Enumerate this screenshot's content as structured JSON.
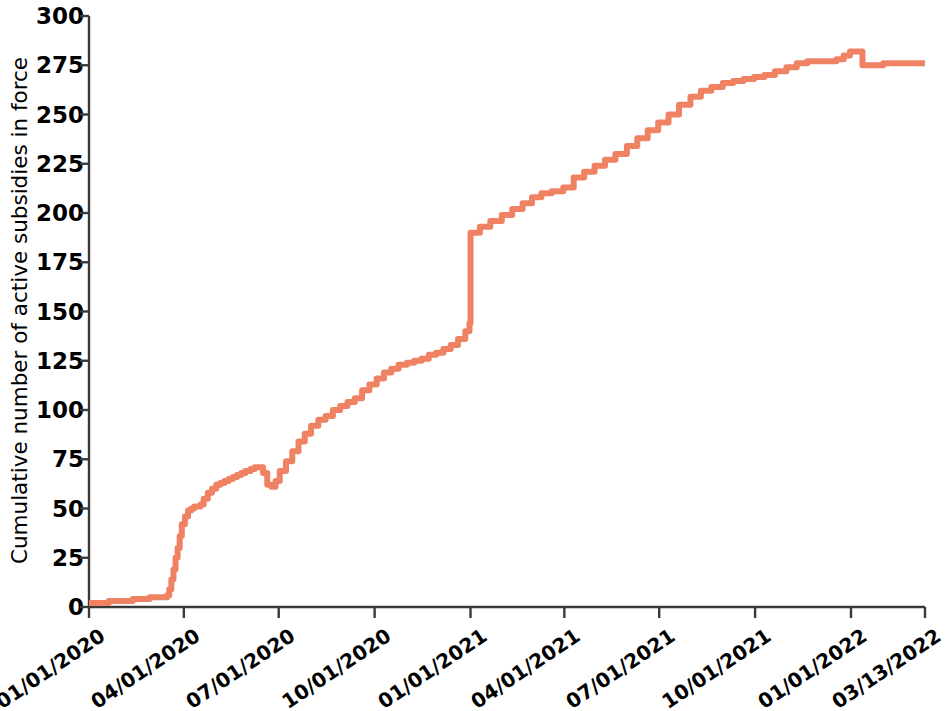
{
  "chart_data": {
    "type": "line",
    "title": "",
    "xlabel": "",
    "ylabel": "Cumulative number of active subsidies in force",
    "ylim": [
      0,
      300
    ],
    "ytick_labels": [
      "300",
      "275",
      "250",
      "225",
      "200",
      "175",
      "150",
      "125",
      "100",
      "75",
      "50",
      "25",
      "0"
    ],
    "ytick_values": [
      300,
      275,
      250,
      225,
      200,
      175,
      150,
      125,
      100,
      75,
      50,
      25,
      0
    ],
    "xtick_labels": [
      "01/01/2020",
      "04/01/2020",
      "07/01/2020",
      "10/01/2020",
      "01/01/2021",
      "04/01/2021",
      "07/01/2021",
      "10/01/2021",
      "01/01/2022",
      "03/13/2022"
    ],
    "grid": false,
    "legend": "none",
    "line_color": "#F08264",
    "line_width": 6,
    "step_shape": "post",
    "x_start": "01/01/2020",
    "x_end": "03/13/2022",
    "series": [
      {
        "name": "Cumulative active subsidies in force",
        "x": [
          "01/01/2020",
          "01/08/2020",
          "01/20/2020",
          "02/01/2020",
          "02/12/2020",
          "02/20/2020",
          "02/28/2020",
          "03/05/2020",
          "03/12/2020",
          "03/16/2020",
          "03/18/2020",
          "03/20/2020",
          "03/22/2020",
          "03/24/2020",
          "03/26/2020",
          "03/28/2020",
          "03/30/2020",
          "04/02/2020",
          "04/05/2020",
          "04/08/2020",
          "04/11/2020",
          "04/14/2020",
          "04/17/2020",
          "04/20/2020",
          "04/24/2020",
          "04/28/2020",
          "05/02/2020",
          "05/06/2020",
          "05/10/2020",
          "05/14/2020",
          "05/18/2020",
          "05/22/2020",
          "05/26/2020",
          "05/30/2020",
          "06/04/2020",
          "06/08/2020",
          "06/12/2020",
          "06/16/2020",
          "06/20/2020",
          "06/24/2020",
          "06/28/2020",
          "07/02/2020",
          "07/08/2020",
          "07/14/2020",
          "07/20/2020",
          "07/26/2020",
          "08/01/2020",
          "08/08/2020",
          "08/15/2020",
          "08/22/2020",
          "08/29/2020",
          "09/05/2020",
          "09/12/2020",
          "09/19/2020",
          "09/26/2020",
          "10/03/2020",
          "10/10/2020",
          "10/17/2020",
          "10/24/2020",
          "11/01/2020",
          "11/08/2020",
          "11/15/2020",
          "11/22/2020",
          "11/29/2020",
          "12/06/2020",
          "12/13/2020",
          "12/20/2020",
          "12/27/2020",
          "12/31/2020",
          "01/01/2021",
          "01/10/2021",
          "01/20/2021",
          "01/31/2021",
          "02/10/2021",
          "02/20/2021",
          "03/01/2021",
          "03/10/2021",
          "03/20/2021",
          "03/31/2021",
          "04/10/2021",
          "04/20/2021",
          "04/30/2021",
          "05/10/2021",
          "05/20/2021",
          "05/31/2021",
          "06/10/2021",
          "06/20/2021",
          "06/30/2021",
          "07/10/2021",
          "07/20/2021",
          "07/31/2021",
          "08/10/2021",
          "08/20/2021",
          "08/31/2021",
          "09/10/2021",
          "09/20/2021",
          "09/30/2021",
          "10/10/2021",
          "10/20/2021",
          "10/31/2021",
          "11/10/2021",
          "11/20/2021",
          "11/30/2021",
          "12/10/2021",
          "12/18/2021",
          "12/25/2021",
          "12/31/2021",
          "01/05/2022",
          "01/12/2022",
          "02/01/2022",
          "03/13/2022"
        ],
        "y": [
          2,
          2,
          3,
          3,
          4,
          4,
          5,
          5,
          5,
          6,
          9,
          14,
          19,
          25,
          30,
          36,
          42,
          46,
          49,
          50,
          51,
          51,
          52,
          55,
          58,
          60,
          62,
          63,
          64,
          65,
          66,
          67,
          68,
          69,
          70,
          71,
          71,
          68,
          62,
          61,
          64,
          69,
          74,
          79,
          84,
          88,
          92,
          95,
          97,
          100,
          102,
          104,
          106,
          110,
          113,
          116,
          119,
          121,
          123,
          124,
          125,
          126,
          128,
          129,
          131,
          133,
          136,
          140,
          144,
          190,
          193,
          196,
          199,
          202,
          205,
          208,
          210,
          211,
          213,
          218,
          221,
          224,
          227,
          230,
          234,
          238,
          242,
          246,
          250,
          255,
          259,
          262,
          264,
          266,
          267,
          268,
          269,
          270,
          272,
          274,
          276,
          277,
          277,
          277,
          278,
          280,
          282,
          282,
          275,
          276,
          276
        ]
      }
    ],
    "annotations": [
      {
        "label": "sharp step increase at 01/01/2021",
        "from": 144,
        "to": 190
      },
      {
        "label": "local dip late June 2020",
        "from": 71,
        "to": 61
      },
      {
        "label": "final plateau",
        "value": 276
      }
    ]
  },
  "axis": {
    "y_title": "Cumulative number of active subsidies in force"
  }
}
